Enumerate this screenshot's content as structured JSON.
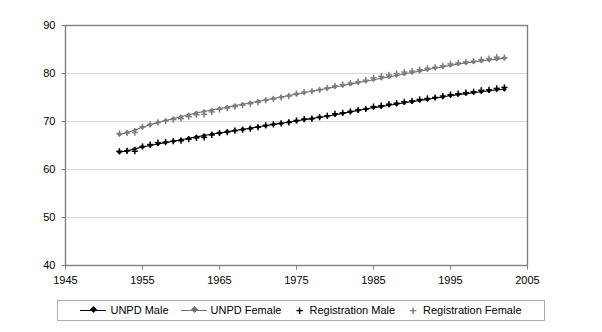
{
  "chart_data": {
    "type": "line",
    "title": "",
    "xlabel": "",
    "ylabel": "",
    "xlim": [
      1945,
      2005
    ],
    "ylim": [
      40,
      90
    ],
    "xticks": [
      1945,
      1955,
      1965,
      1975,
      1985,
      1995,
      2005
    ],
    "yticks": [
      40,
      50,
      60,
      70,
      80,
      90
    ],
    "grid": "horizontal",
    "legend_position": "bottom",
    "colors": {
      "unpd_male": "#000000",
      "unpd_female": "#707070",
      "registration_male": "#000000",
      "registration_female": "#808080",
      "grid": "#d9d9d9",
      "axis": "#7f7f7f",
      "legend_border": "#adadad"
    },
    "x": [
      1952,
      1953,
      1954,
      1955,
      1956,
      1957,
      1958,
      1959,
      1960,
      1961,
      1962,
      1963,
      1964,
      1965,
      1966,
      1967,
      1968,
      1969,
      1970,
      1971,
      1972,
      1973,
      1974,
      1975,
      1976,
      1977,
      1978,
      1979,
      1980,
      1981,
      1982,
      1983,
      1984,
      1985,
      1986,
      1987,
      1988,
      1989,
      1990,
      1991,
      1992,
      1993,
      1994,
      1995,
      1996,
      1997,
      1998,
      1999,
      2000,
      2001,
      2002
    ],
    "series": [
      {
        "name": "UNPD Male",
        "marker": "diamond",
        "line": true,
        "color": "#000000",
        "values": [
          63.6,
          63.9,
          64.3,
          64.7,
          65.0,
          65.3,
          65.6,
          65.9,
          66.2,
          66.5,
          66.8,
          67.1,
          67.4,
          67.6,
          67.9,
          68.1,
          68.4,
          68.6,
          68.9,
          69.1,
          69.4,
          69.6,
          69.9,
          70.1,
          70.4,
          70.6,
          70.9,
          71.1,
          71.4,
          71.7,
          72.0,
          72.3,
          72.6,
          72.9,
          73.1,
          73.4,
          73.6,
          73.9,
          74.1,
          74.4,
          74.6,
          74.9,
          75.1,
          75.4,
          75.6,
          75.8,
          76.0,
          76.2,
          76.4,
          76.6,
          76.7
        ]
      },
      {
        "name": "UNPD Female",
        "marker": "diamond",
        "line": true,
        "color": "#707070",
        "values": [
          67.3,
          67.7,
          68.2,
          68.8,
          69.3,
          69.8,
          70.2,
          70.6,
          71.0,
          71.4,
          71.8,
          72.1,
          72.4,
          72.7,
          73.0,
          73.3,
          73.6,
          73.9,
          74.2,
          74.5,
          74.8,
          75.1,
          75.4,
          75.7,
          76.0,
          76.3,
          76.6,
          76.9,
          77.2,
          77.5,
          77.8,
          78.1,
          78.4,
          78.7,
          79.0,
          79.3,
          79.6,
          79.9,
          80.2,
          80.5,
          80.8,
          81.1,
          81.4,
          81.7,
          82.0,
          82.2,
          82.4,
          82.6,
          82.8,
          83.0,
          83.2
        ]
      },
      {
        "name": "Registration Male",
        "marker": "plus",
        "line": false,
        "color": "#000000",
        "values": [
          63.8,
          63.9,
          63.8,
          64.8,
          65.2,
          65.6,
          65.7,
          65.9,
          66.0,
          66.3,
          66.6,
          66.7,
          67.2,
          67.6,
          67.8,
          68.1,
          68.3,
          68.5,
          68.8,
          69.2,
          69.4,
          69.6,
          69.8,
          70.2,
          70.5,
          70.6,
          70.9,
          71.2,
          71.6,
          71.8,
          72.1,
          72.4,
          72.6,
          73.1,
          73.3,
          73.6,
          73.8,
          74.1,
          74.3,
          74.6,
          74.8,
          75.0,
          75.3,
          75.6,
          75.8,
          76.0,
          76.2,
          76.5,
          76.6,
          76.9,
          77.1
        ]
      },
      {
        "name": "Registration Female",
        "marker": "plus",
        "line": false,
        "color": "#808080",
        "values": [
          67.5,
          67.6,
          67.7,
          68.9,
          69.4,
          69.8,
          70.1,
          70.4,
          70.6,
          71.0,
          71.4,
          71.5,
          72.0,
          72.5,
          72.8,
          73.1,
          73.4,
          73.7,
          74.0,
          74.4,
          74.7,
          75.0,
          75.3,
          75.8,
          76.1,
          76.3,
          76.6,
          77.0,
          77.4,
          77.7,
          78.0,
          78.3,
          78.6,
          79.1,
          79.4,
          79.7,
          80.0,
          80.3,
          80.5,
          80.8,
          81.1,
          81.3,
          81.6,
          82.0,
          82.2,
          82.4,
          82.6,
          82.9,
          83.1,
          83.4,
          83.3
        ]
      }
    ]
  },
  "axis": {
    "y_labels": [
      "90",
      "80",
      "70",
      "60",
      "50",
      "40"
    ],
    "x_labels": [
      "1945",
      "1955",
      "1965",
      "1975",
      "1985",
      "1995",
      "2005"
    ]
  },
  "legend": {
    "items": [
      {
        "label": "UNPD Male",
        "key": "line-diamond-marker",
        "color": "#000000"
      },
      {
        "label": "UNPD Female",
        "key": "line-diamond-marker",
        "color": "#707070"
      },
      {
        "label": "Registration Male",
        "key": "plus-marker",
        "color": "#000000"
      },
      {
        "label": "Registration Female",
        "key": "plus-marker",
        "color": "#808080"
      }
    ]
  }
}
